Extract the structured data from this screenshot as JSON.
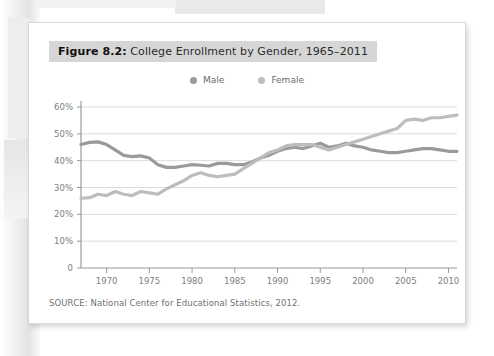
{
  "page": {
    "background_color": "#ffffff",
    "card_color": "#ffffff"
  },
  "caption": {
    "figure_number": "Figure 8.2:",
    "title": " College Enrollment by Gender, 1965–2011",
    "full_text": "Figure 8.2: College Enrollment by Gender, 1965–2011",
    "band_color": "#d6d6d6"
  },
  "legend": {
    "position": "top-center",
    "items": [
      {
        "label": "Male",
        "color": "#9a9a9a"
      },
      {
        "label": "Female",
        "color": "#bdbdbd"
      }
    ]
  },
  "source": {
    "text": "SOURCE: National Center for Educational Statistics, 2012."
  },
  "chart_data": {
    "type": "line",
    "title": "College Enrollment by Gender, 1965–2011",
    "xlabel": "",
    "ylabel": "",
    "xlim": [
      1967,
      2011
    ],
    "ylim": [
      0,
      60
    ],
    "grid": true,
    "legend_position": "top-center",
    "y_ticks": [
      0,
      10,
      20,
      30,
      40,
      50,
      60
    ],
    "y_tick_labels": [
      "0",
      "10%",
      "20%",
      "30%",
      "40%",
      "50%",
      "60%"
    ],
    "x_ticks": [
      1970,
      1975,
      1980,
      1985,
      1990,
      1995,
      2000,
      2005,
      2010
    ],
    "x_tick_labels": [
      "1970",
      "1975",
      "1980",
      "1985",
      "1990",
      "1995",
      "2000",
      "2005",
      "2010"
    ],
    "x": [
      1967,
      1968,
      1969,
      1970,
      1971,
      1972,
      1973,
      1974,
      1975,
      1976,
      1977,
      1978,
      1979,
      1980,
      1981,
      1982,
      1983,
      1984,
      1985,
      1986,
      1987,
      1988,
      1989,
      1990,
      1991,
      1992,
      1993,
      1994,
      1995,
      1996,
      1997,
      1998,
      1999,
      2000,
      2001,
      2002,
      2003,
      2004,
      2005,
      2006,
      2007,
      2008,
      2009,
      2010,
      2011
    ],
    "series": [
      {
        "name": "Male",
        "color": "#9a9a9a",
        "values": [
          46.0,
          46.8,
          47.0,
          46.0,
          44.0,
          42.0,
          41.5,
          41.8,
          41.0,
          38.5,
          37.5,
          37.5,
          38.0,
          38.5,
          38.3,
          38.0,
          39.0,
          39.0,
          38.5,
          38.5,
          39.5,
          41.0,
          42.0,
          43.5,
          44.5,
          45.0,
          44.5,
          45.5,
          46.5,
          45.0,
          45.5,
          46.5,
          45.5,
          45.0,
          44.0,
          43.5,
          43.0,
          43.0,
          43.5,
          44.0,
          44.5,
          44.5,
          44.0,
          43.5,
          43.5
        ]
      },
      {
        "name": "Female",
        "color": "#bdbdbd",
        "values": [
          26.0,
          26.2,
          27.5,
          27.0,
          28.5,
          27.5,
          27.0,
          28.5,
          28.0,
          27.5,
          29.5,
          31.0,
          32.5,
          34.5,
          35.5,
          34.5,
          34.0,
          34.5,
          35.0,
          37.0,
          39.0,
          41.0,
          43.0,
          44.0,
          45.5,
          46.0,
          46.0,
          46.0,
          45.0,
          44.0,
          45.0,
          46.0,
          47.0,
          48.0,
          49.0,
          50.0,
          51.0,
          52.0,
          55.0,
          55.5,
          55.0,
          56.0,
          56.0,
          56.5,
          57.0
        ]
      }
    ]
  }
}
